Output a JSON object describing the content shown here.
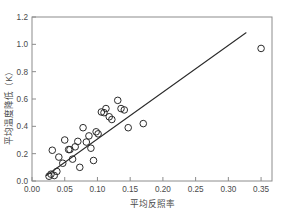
{
  "chart_data": {
    "type": "scatter",
    "title": "",
    "xlabel": "平均反照率",
    "ylabel": "平均温度降低（K）",
    "xlim": [
      0.0,
      0.3667
    ],
    "ylim": [
      0.0,
      1.2
    ],
    "grid": false,
    "legend": null,
    "marker_style": "open-circle",
    "xticks": [
      0.0,
      0.05,
      0.1,
      0.15,
      0.2,
      0.25,
      0.3,
      0.35
    ],
    "xtick_labels": [
      "0.00",
      "0.05",
      "0.10",
      "0.15",
      "0.20",
      "0.25",
      "0.30",
      "0.35"
    ],
    "yticks": [
      0.0,
      0.2,
      0.4,
      0.6,
      0.8,
      1.0,
      1.2
    ],
    "ytick_labels": [
      "0.0",
      "0.2",
      "0.4",
      "0.6",
      "0.8",
      "1.0",
      "1.2"
    ],
    "x": [
      0.026,
      0.029,
      0.031,
      0.034,
      0.038,
      0.041,
      0.047,
      0.05,
      0.056,
      0.058,
      0.062,
      0.066,
      0.07,
      0.073,
      0.078,
      0.083,
      0.087,
      0.09,
      0.094,
      0.098,
      0.101,
      0.106,
      0.11,
      0.113,
      0.118,
      0.122,
      0.131,
      0.136,
      0.141,
      0.147,
      0.17,
      0.35
    ],
    "y": [
      0.035,
      0.05,
      0.225,
      0.04,
      0.07,
      0.175,
      0.13,
      0.3,
      0.23,
      0.23,
      0.16,
      0.25,
      0.29,
      0.1,
      0.39,
      0.285,
      0.33,
      0.24,
      0.15,
      0.36,
      0.345,
      0.505,
      0.5,
      0.53,
      0.47,
      0.45,
      0.59,
      0.53,
      0.52,
      0.39,
      0.42,
      0.97
    ],
    "trendline": {
      "type": "linear",
      "x_start": 0.022,
      "y_start": 0.04,
      "x_end": 0.327,
      "y_end": 1.085
    },
    "colors": {
      "marker_stroke": "#2b2b2b",
      "trendline": "#2b2b2b",
      "frame": "#8c8c8c",
      "text": "#4a4a4a",
      "background": "#ffffff"
    }
  }
}
